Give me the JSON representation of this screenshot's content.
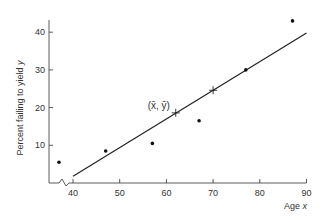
{
  "chart_data": {
    "type": "scatter",
    "title": "",
    "xlabel": "Age",
    "xlabel_var": "x",
    "ylabel": "Percent failing to yield",
    "ylabel_var": "y",
    "xlim": [
      35,
      90
    ],
    "ylim": [
      0,
      45
    ],
    "axis_break_x": true,
    "x_ticks": [
      40,
      50,
      60,
      70,
      80,
      90
    ],
    "y_ticks": [
      10,
      20,
      30,
      40
    ],
    "grid": false,
    "series": [
      {
        "name": "observations",
        "type": "scatter",
        "points": [
          {
            "x": 37,
            "y": 5.5
          },
          {
            "x": 47,
            "y": 8.5
          },
          {
            "x": 57,
            "y": 10.5
          },
          {
            "x": 67,
            "y": 16.5
          },
          {
            "x": 77,
            "y": 30
          },
          {
            "x": 87,
            "y": 43
          }
        ]
      },
      {
        "name": "regression line",
        "type": "line",
        "points": [
          {
            "x": 40,
            "y": 1.8
          },
          {
            "x": 90,
            "y": 39.8
          }
        ]
      },
      {
        "name": "line markers",
        "type": "cross",
        "points": [
          {
            "x": 62,
            "y": 18.6
          },
          {
            "x": 70,
            "y": 24.6
          }
        ]
      }
    ],
    "annotations": [
      {
        "text": "(x̄, ȳ)",
        "x": 62,
        "y": 18.6
      }
    ]
  }
}
